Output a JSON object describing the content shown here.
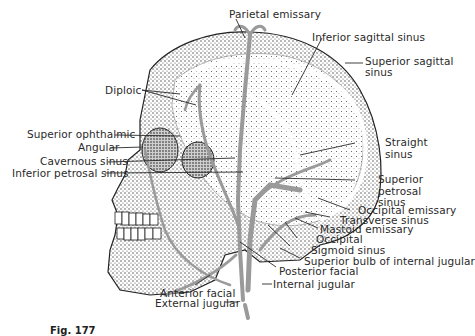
{
  "figure": {
    "caption": "Fig. 177",
    "colors": {
      "stipple": "#3a3a3a",
      "vein": "#9a9a9a",
      "line": "#2a2a2a",
      "background": "#ffffff"
    }
  },
  "labels": {
    "parietal_emissary": "Parietal emissary",
    "inferior_sagittal_sinus": "Inferior sagittal sinus",
    "superior_sagittal_sinus_1": "Superior sagittal",
    "superior_sagittal_sinus_2": "sinus",
    "diploic": "Diploic",
    "superior_ophthalmic": "Superior ophthalmic",
    "angular": "Angular",
    "cavernous_sinus": "Cavernous sinus",
    "inferior_petrosal_sinus": "Inferior petrosal sinus",
    "straight_sinus_1": "Straight",
    "straight_sinus_2": "sinus",
    "superior_petrosal_sinus_1": "Superior",
    "superior_petrosal_sinus_2": "petrosal",
    "superior_petrosal_sinus_3": "sinus",
    "occipital_emissary": "Occipital emissary",
    "transverse_sinus": "Transverse sinus",
    "mastoid_emissary": "Mastoid emissary",
    "occipital": "Occipital",
    "sigmoid_sinus": "Sigmoid sinus",
    "superior_bulb": "Superior bulb of internal jugular",
    "posterior_facial": "Posterior facial",
    "internal_jugular": "Internal jugular",
    "anterior_facial": "Anterior facial",
    "external_jugular": "External jugular"
  }
}
